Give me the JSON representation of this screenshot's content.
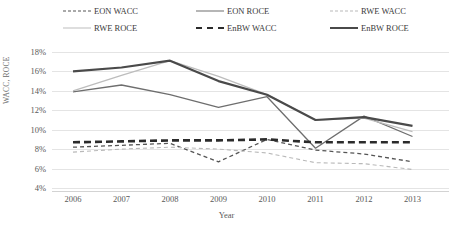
{
  "chart_data": {
    "type": "line",
    "title": "",
    "xlabel": "Year",
    "ylabel": "WACC, ROCE",
    "categories": [
      "2006",
      "2007",
      "2008",
      "2009",
      "2010",
      "2011",
      "2012",
      "2013"
    ],
    "x": [
      2006,
      2007,
      2008,
      2009,
      2010,
      2011,
      2012,
      2013
    ],
    "ylim": [
      4,
      18
    ],
    "ytick_labels": [
      "18%",
      "16%",
      "14%",
      "12%",
      "10%",
      "8%",
      "6%",
      "4%"
    ],
    "ytick_values": [
      18,
      16,
      14,
      12,
      10,
      8,
      6,
      4
    ],
    "y_unit": "%",
    "grid": true,
    "legend_position": "top",
    "series": [
      {
        "name": "EON WACC",
        "style": "dashed",
        "color": "#555555",
        "width": 1.3,
        "values": [
          8.2,
          8.4,
          8.6,
          6.7,
          9.0,
          7.9,
          7.5,
          6.7
        ]
      },
      {
        "name": "EON ROCE",
        "style": "solid",
        "color": "#6e6e6e",
        "width": 1.3,
        "values": [
          13.9,
          14.6,
          13.6,
          12.3,
          13.4,
          8.1,
          11.4,
          9.3
        ]
      },
      {
        "name": "RWE WACC",
        "style": "dashed",
        "color": "#b9b9b9",
        "width": 1.1,
        "values": [
          7.7,
          8.0,
          8.2,
          8.0,
          7.6,
          6.6,
          6.5,
          5.9
        ]
      },
      {
        "name": "RWE ROCE",
        "style": "solid",
        "color": "#bdbdbd",
        "width": 1.3,
        "values": [
          14.0,
          15.6,
          17.1,
          15.5,
          13.6,
          11.0,
          11.2,
          9.8
        ]
      },
      {
        "name": "EnBW WACC",
        "style": "dashed",
        "color": "#2b2b2b",
        "width": 2.6,
        "values": [
          8.7,
          8.8,
          8.9,
          8.9,
          9.0,
          8.7,
          8.7,
          8.7
        ]
      },
      {
        "name": "EnBW ROCE",
        "style": "solid",
        "color": "#4a4a4a",
        "width": 2.2,
        "values": [
          16.0,
          16.4,
          17.1,
          15.0,
          13.6,
          11.0,
          11.3,
          10.4
        ]
      }
    ]
  },
  "legend": {
    "items": [
      {
        "label": "EON WACC"
      },
      {
        "label": "EON ROCE"
      },
      {
        "label": "RWE WACC"
      },
      {
        "label": "RWE ROCE"
      },
      {
        "label": "EnBW WACC"
      },
      {
        "label": "EnBW ROCE"
      }
    ]
  },
  "axes": {
    "y_title": "WACC, ROCE",
    "x_title": "Year"
  }
}
